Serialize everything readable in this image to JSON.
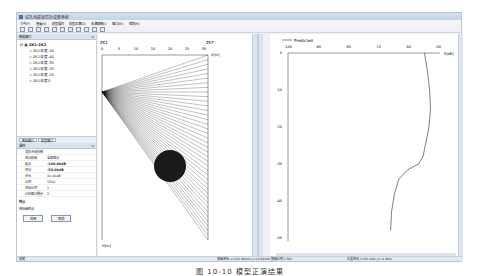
{
  "window": {
    "title": "钻孔电磁波层析成像系统"
  },
  "menu": [
    "文件(F)",
    "查看(V)",
    "模型操作",
    "模型正演(D)",
    "反演解释(I)",
    "窗口(W)",
    "帮助(H)"
  ],
  "toolbar": {
    "icons": [
      "new-icon",
      "open-icon",
      "save-icon",
      "zoom-in-icon",
      "zoom-out-icon",
      "fit-icon",
      "cut-icon",
      "refresh-icon",
      "pan-icon",
      "select-icon",
      "settings-icon"
    ]
  },
  "tree_panel": {
    "title": "数据窗口",
    "root": "ZK1-ZK2",
    "items": [
      "ZK1深度-50",
      "ZK1深度-40",
      "ZK1深度-30",
      "ZK1深度-20",
      "ZK1深度-10",
      "ZK1深度0"
    ],
    "tabs": [
      "数据窗口",
      "模型窗口"
    ]
  },
  "properties_panel": {
    "title": "属性",
    "section": "发射天线参数",
    "rows": [
      {
        "key": "显示模板",
        "value": "全部显示"
      },
      {
        "key": "起点",
        "value": "-100.00dB"
      },
      {
        "key": "终点",
        "value": "-50.00dB"
      },
      {
        "key": "步长",
        "value": "10.00dB"
      },
      {
        "key": "比例",
        "value": "1500"
      },
      {
        "key": "坐标比例",
        "value": "1"
      },
      {
        "key": "比较图与剩余",
        "value": "2"
      }
    ],
    "desc_title": "终点",
    "desc_text": "坐标轴终点",
    "apply_label": "应用",
    "cancel_label": "取消"
  },
  "model_view": {
    "left_well": "ZK1",
    "right_well": "ZK7",
    "x_label": "X[m]",
    "y_label": "H[m]",
    "x_ticks": [
      "0",
      "5",
      "10",
      "15",
      "20",
      "25",
      "30"
    ],
    "y_ticks": [
      "0",
      "-10",
      "-20",
      "-30",
      "-40",
      "-50"
    ],
    "anomaly": {
      "shape": "circle",
      "center_x": 20,
      "center_y": -30,
      "radius": 5
    }
  },
  "chart_data": {
    "type": "line",
    "title": "",
    "legend": [
      "Predicted"
    ],
    "xlabel": "E[dB]",
    "ylabel": "",
    "x_ticks": [
      "-100",
      "-90",
      "-80",
      "-70",
      "-60",
      "-50"
    ],
    "y_ticks": [
      "0",
      "-10",
      "-20",
      "-30",
      "-40",
      "-50"
    ],
    "xlim": [
      -100,
      -50
    ],
    "ylim": [
      -50,
      0
    ],
    "series": [
      {
        "name": "Predicted",
        "x": [
          -54.5,
          -53.5,
          -52.8,
          -52.5,
          -53.0,
          -54.0,
          -55.0,
          -56.5,
          -60.0,
          -63.0,
          -64.5,
          -65.5,
          -65.8
        ],
        "y": [
          0,
          -5,
          -10,
          -15,
          -20,
          -24,
          -28,
          -30,
          -31.5,
          -34,
          -38,
          -43,
          -48
        ]
      }
    ]
  },
  "status": {
    "left": "就绪",
    "coords": "屏幕坐标 x=222.40mm,y=12.92mm  屏幕比例1:502",
    "model_coords": "位置坐标 x=61.24m,y=-4.40m"
  },
  "caption": "图 10-10   模型正演结果"
}
